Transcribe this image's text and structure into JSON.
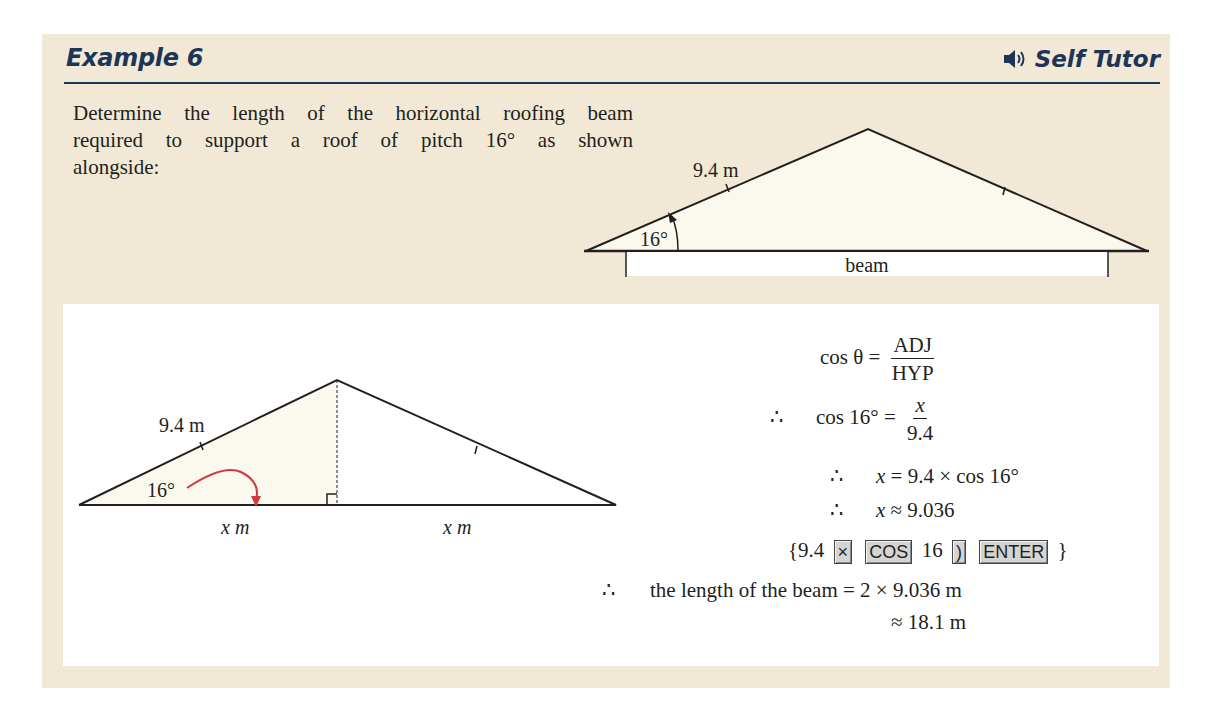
{
  "header": {
    "title": "Example 6",
    "self_tutor_label": "Self Tutor",
    "icon": "speaker-icon",
    "accent_color": "#1d3557"
  },
  "question": {
    "lines": [
      "Determine the length of the horizontal roofing beam",
      "required to support a roof of pitch 16° as shown",
      "alongside:"
    ]
  },
  "top_diagram": {
    "side_label": "9.4 m",
    "angle_label": "16°",
    "beam_label": "beam"
  },
  "bottom_diagram": {
    "side_label": "9.4 m",
    "angle_label": "16°",
    "left_base_label": "x m",
    "right_base_label": "x m",
    "arrow_color": "#d2383f"
  },
  "solution": {
    "line1": {
      "lhs": "cos θ =",
      "num": "ADJ",
      "den": "HYP"
    },
    "line2": {
      "prefix": "∴",
      "lhs": "cos 16° =",
      "num": "x",
      "den": "9.4"
    },
    "line3": {
      "prefix": "∴",
      "text_x": "x",
      "text": "= 9.4 × cos 16°"
    },
    "line4": {
      "prefix": "∴",
      "text_x": "x",
      "text": "≈ 9.036"
    },
    "calc": {
      "open": "{9.4",
      "key1": "×",
      "key2": "COS",
      "mid": "16",
      "key3": ")",
      "key4": "ENTER",
      "close": "}"
    },
    "line6": {
      "prefix": "∴",
      "text": "the length of the beam = 2 × 9.036 m"
    },
    "line7": {
      "text": "≈ 18.1 m"
    }
  },
  "colors": {
    "background": "#f1e9d6",
    "panel": "#ffffff",
    "triangle_fill": "#fbf8ed"
  }
}
